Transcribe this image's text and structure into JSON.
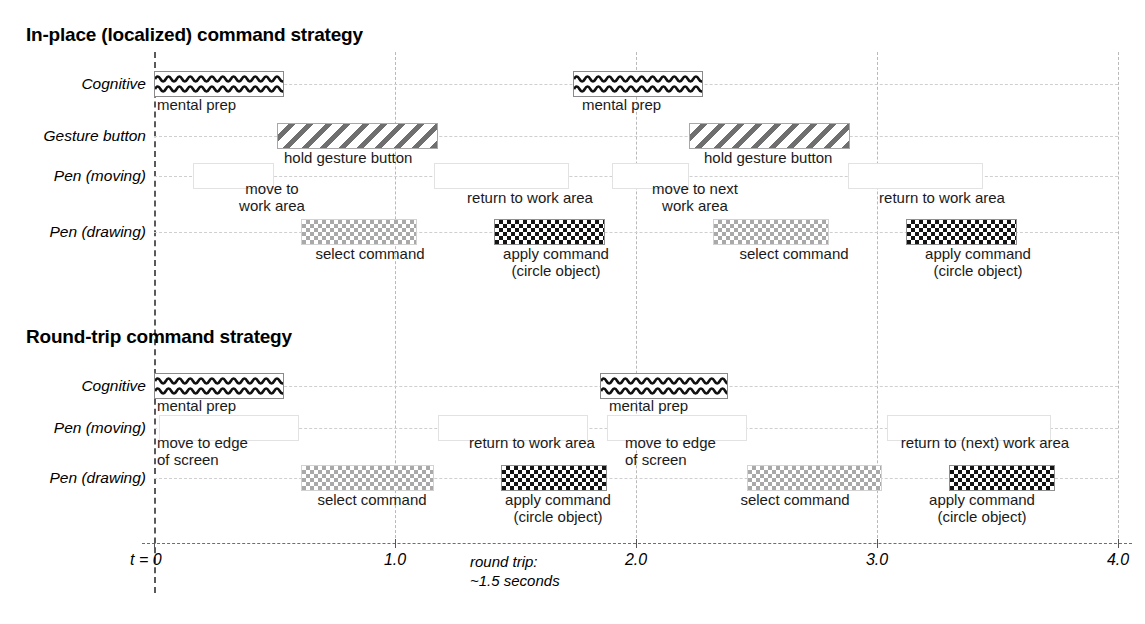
{
  "figure": {
    "title_top": "In-place (localized) command strategy",
    "title_bottom": "Round-trip command strategy"
  },
  "chart_data": {
    "type": "timeline",
    "xlabel": "t",
    "x_unit": "seconds",
    "xlim": [
      0,
      4.0
    ],
    "grid": true,
    "legend": "none",
    "axis_ticks": [
      {
        "value": 0,
        "label": "t = 0"
      },
      {
        "value": 1.0,
        "label": "1.0"
      },
      {
        "value": 2.0,
        "label": "2.0"
      },
      {
        "value": 3.0,
        "label": "3.0"
      },
      {
        "value": 4.0,
        "label": "4.0"
      }
    ],
    "annotation": "round trip:\n~1.5 seconds",
    "sections": [
      {
        "name": "In-place (localized) command strategy",
        "rows": [
          {
            "label": "Cognitive"
          },
          {
            "label": "Gesture button"
          },
          {
            "label": "Pen (moving)"
          },
          {
            "label": "Pen (drawing)"
          }
        ],
        "bars": [
          {
            "row": "Cognitive",
            "pattern": "wavy",
            "start": 0.0,
            "end": 0.54,
            "caption": "mental prep"
          },
          {
            "row": "Cognitive",
            "pattern": "wavy",
            "start": 1.74,
            "end": 2.28,
            "caption": "mental prep"
          },
          {
            "row": "Gesture button",
            "pattern": "stripe",
            "start": 0.51,
            "end": 1.18,
            "caption": "hold gesture button"
          },
          {
            "row": "Gesture button",
            "pattern": "stripe",
            "start": 2.22,
            "end": 2.89,
            "caption": "hold gesture button"
          },
          {
            "row": "Pen (moving)",
            "pattern": "moving",
            "start": 0.16,
            "end": 0.5,
            "caption": "move to\nwork area"
          },
          {
            "row": "Pen (moving)",
            "pattern": "moving",
            "start": 1.16,
            "end": 1.72,
            "caption": "return to work area"
          },
          {
            "row": "Pen (moving)",
            "pattern": "moving",
            "start": 1.9,
            "end": 2.22,
            "caption": "move to next\nwork area"
          },
          {
            "row": "Pen (moving)",
            "pattern": "moving",
            "start": 2.88,
            "end": 3.44,
            "caption": "return to work area"
          },
          {
            "row": "Pen (drawing)",
            "pattern": "check-light",
            "start": 0.61,
            "end": 1.09,
            "caption": "select command"
          },
          {
            "row": "Pen (drawing)",
            "pattern": "check-dark",
            "start": 1.41,
            "end": 1.87,
            "caption": "apply command\n(circle object)"
          },
          {
            "row": "Pen (drawing)",
            "pattern": "check-light",
            "start": 2.32,
            "end": 2.8,
            "caption": "select command"
          },
          {
            "row": "Pen (drawing)",
            "pattern": "check-dark",
            "start": 3.12,
            "end": 3.58,
            "caption": "apply command\n(circle object)"
          }
        ]
      },
      {
        "name": "Round-trip command strategy",
        "rows": [
          {
            "label": "Cognitive"
          },
          {
            "label": "Pen (moving)"
          },
          {
            "label": "Pen (drawing)"
          }
        ],
        "bars": [
          {
            "row": "Cognitive",
            "pattern": "wavy",
            "start": 0.0,
            "end": 0.54,
            "caption": "mental prep"
          },
          {
            "row": "Cognitive",
            "pattern": "wavy",
            "start": 1.85,
            "end": 2.38,
            "caption": "mental prep"
          },
          {
            "row": "Pen (moving)",
            "pattern": "moving",
            "start": 0.02,
            "end": 0.6,
            "caption": "move to edge\nof screen"
          },
          {
            "row": "Pen (moving)",
            "pattern": "moving",
            "start": 1.18,
            "end": 1.8,
            "caption": "return to work area"
          },
          {
            "row": "Pen (moving)",
            "pattern": "moving",
            "start": 1.88,
            "end": 2.46,
            "caption": "move to edge\nof screen"
          },
          {
            "row": "Pen (moving)",
            "pattern": "moving",
            "start": 3.04,
            "end": 3.72,
            "caption": "return to (next) work area"
          },
          {
            "row": "Pen (drawing)",
            "pattern": "check-light",
            "start": 0.61,
            "end": 1.16,
            "caption": "select command"
          },
          {
            "row": "Pen (drawing)",
            "pattern": "check-dark",
            "start": 1.44,
            "end": 1.88,
            "caption": "apply command\n(circle object)"
          },
          {
            "row": "Pen (drawing)",
            "pattern": "check-light",
            "start": 2.46,
            "end": 3.02,
            "caption": "select command"
          },
          {
            "row": "Pen (drawing)",
            "pattern": "check-dark",
            "start": 3.3,
            "end": 3.74,
            "caption": "apply command\n(circle object)"
          }
        ]
      }
    ]
  }
}
